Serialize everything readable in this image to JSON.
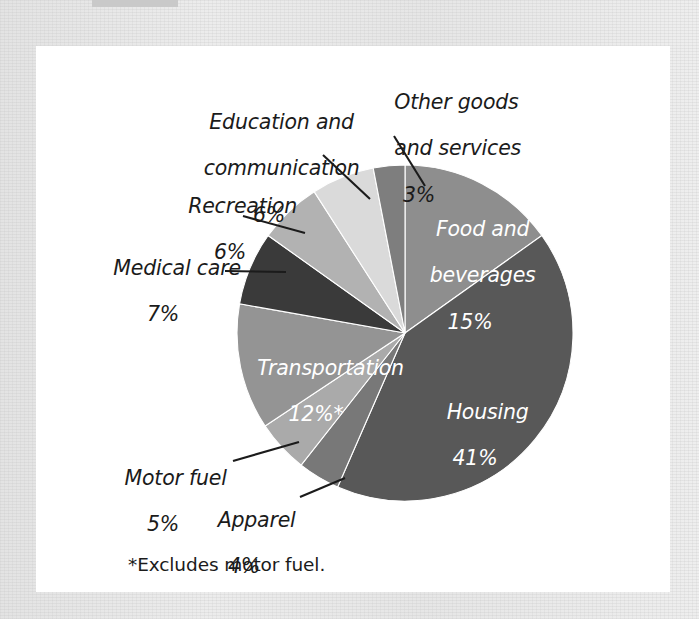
{
  "figure": {
    "footnote": "*Excludes motor fuel.",
    "background_color": "#ffffff",
    "border_color": "#e6e6e6"
  },
  "chart_data": {
    "type": "pie",
    "title": "",
    "subtitle": "",
    "xlabel": "",
    "ylabel": "",
    "legend_position": "none",
    "grid": false,
    "units": "percent",
    "total": 99,
    "note": "*Excludes motor fuel.",
    "start_angle_deg": 0,
    "direction": "clockwise",
    "categories": [
      "Food and beverages",
      "Housing",
      "Apparel",
      "Motor fuel",
      "Transportation",
      "Medical care",
      "Recreation",
      "Education and communication",
      "Other goods and services"
    ],
    "values": [
      15,
      41,
      4,
      5,
      12,
      7,
      6,
      6,
      3
    ],
    "colors": [
      "#8e8e8e",
      "#585858",
      "#787878",
      "#aaaaaa",
      "#949494",
      "#3a3a3a",
      "#b2b2b2",
      "#dadada",
      "#7e7e7e"
    ],
    "slices": [
      {
        "label": "Food and beverages",
        "name_line1": "Food and",
        "name_line2": "beverages",
        "value": 15,
        "pct_text": "15%",
        "color": "#8e8e8e",
        "label_placement": "inside",
        "label_color": "#ffffff"
      },
      {
        "label": "Housing",
        "name_line1": "Housing",
        "name_line2": "",
        "value": 41,
        "pct_text": "41%",
        "color": "#585858",
        "label_placement": "inside",
        "label_color": "#ffffff"
      },
      {
        "label": "Apparel",
        "name_line1": "Apparel",
        "name_line2": "",
        "value": 4,
        "pct_text": "4%",
        "color": "#787878",
        "label_placement": "outside",
        "label_color": "#1b1b1b"
      },
      {
        "label": "Motor fuel",
        "name_line1": "Motor fuel",
        "name_line2": "",
        "value": 5,
        "pct_text": "5%",
        "color": "#aaaaaa",
        "label_placement": "outside",
        "label_color": "#1b1b1b"
      },
      {
        "label": "Transportation",
        "name_line1": "Transportation",
        "name_line2": "",
        "value": 12,
        "pct_text": "12%*",
        "color": "#949494",
        "label_placement": "inside",
        "label_color": "#ffffff"
      },
      {
        "label": "Medical care",
        "name_line1": "Medical care",
        "name_line2": "",
        "value": 7,
        "pct_text": "7%",
        "color": "#3a3a3a",
        "label_placement": "outside",
        "label_color": "#1b1b1b"
      },
      {
        "label": "Recreation",
        "name_line1": "Recreation",
        "name_line2": "",
        "value": 6,
        "pct_text": "6%",
        "color": "#b2b2b2",
        "label_placement": "outside",
        "label_color": "#1b1b1b"
      },
      {
        "label": "Education and communication",
        "name_line1": "Education and",
        "name_line2": "communication",
        "value": 6,
        "pct_text": "6%",
        "color": "#dadada",
        "label_placement": "outside",
        "label_color": "#1b1b1b"
      },
      {
        "label": "Other goods and services",
        "name_line1": "Other goods",
        "name_line2": "and services",
        "value": 3,
        "pct_text": "3%",
        "color": "#7e7e7e",
        "label_placement": "outside",
        "label_color": "#1b1b1b"
      }
    ]
  }
}
